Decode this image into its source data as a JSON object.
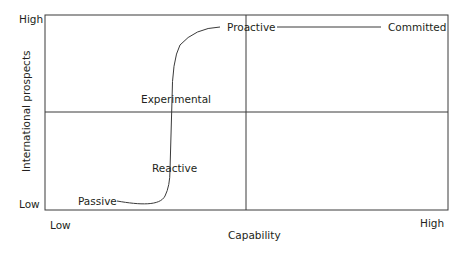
{
  "diagram": {
    "type": "2x2 matrix with internationalization path",
    "x_axis": {
      "label": "Capability",
      "low": "Low",
      "high": "High"
    },
    "y_axis": {
      "label": "International prospects",
      "low": "Low",
      "high": "High"
    },
    "stages": [
      {
        "label": "Passive"
      },
      {
        "label": "Reactive"
      },
      {
        "label": "Experimental"
      },
      {
        "label": "Proactive"
      },
      {
        "label": "Committed"
      }
    ],
    "colors": {
      "line": "#3a3a3a",
      "text": "#231f20",
      "background": "#ffffff"
    }
  }
}
